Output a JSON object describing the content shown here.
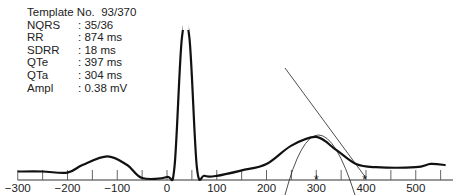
{
  "info": {
    "template": "Template No.  93/370",
    "rows": [
      {
        "key": "NQRS",
        "value": ": 35/36"
      },
      {
        "key": "RR",
        "value": ": 874 ms"
      },
      {
        "key": "SDRR",
        "value": ": 18 ms"
      },
      {
        "key": "QTe",
        "value": ": 397 ms"
      },
      {
        "key": "QTa",
        "value": ": 304 ms"
      },
      {
        "key": "Ampl",
        "value": ": 0.38 mV"
      }
    ]
  },
  "chart_data": {
    "type": "line",
    "title": "Template No. 93/370",
    "xlabel": "",
    "ylabel": "",
    "xlim": [
      -300,
      560
    ],
    "ticks": [
      -300,
      -200,
      -100,
      0,
      100,
      200,
      300,
      400,
      500
    ],
    "minor_tick_step": 50,
    "grid": false,
    "series": [
      {
        "name": "ECG template",
        "points": [
          [
            -300,
            0.06
          ],
          [
            -250,
            0.06
          ],
          [
            -200,
            0.05
          ],
          [
            -170,
            0.12
          ],
          [
            -120,
            0.2
          ],
          [
            -80,
            0.12
          ],
          [
            -50,
            0.0
          ],
          [
            0,
            0.01
          ],
          [
            15,
            0.1
          ],
          [
            30,
            1.3
          ],
          [
            45,
            1.3
          ],
          [
            60,
            0.1
          ],
          [
            75,
            0.02
          ],
          [
            100,
            0.02
          ],
          [
            150,
            0.07
          ],
          [
            200,
            0.13
          ],
          [
            250,
            0.3
          ],
          [
            300,
            0.38
          ],
          [
            340,
            0.26
          ],
          [
            380,
            0.13
          ],
          [
            420,
            0.1
          ],
          [
            500,
            0.1
          ],
          [
            530,
            0.13
          ],
          [
            560,
            0.12
          ]
        ]
      }
    ],
    "annotations": [
      {
        "type": "marker",
        "symbol": "*",
        "x": 300,
        "label": "T peak"
      },
      {
        "type": "marker",
        "symbol": "*",
        "x": 397,
        "label": "T end (QTe)"
      },
      {
        "type": "tangent-line",
        "from_x": 230,
        "to_x": 397
      },
      {
        "type": "parabola-fit",
        "around_x": 300
      }
    ],
    "text": {
      "template_no": "93/370",
      "NQRS": "35/36",
      "RR": "874 ms",
      "SDRR": "18 ms",
      "QTe": "397 ms",
      "QTa": "304 ms",
      "Ampl": "0.38 mV"
    }
  }
}
